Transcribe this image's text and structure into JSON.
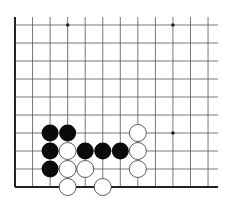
{
  "board": {
    "columns": 12,
    "rows": 10,
    "origin": {
      "x": 15,
      "y": 25
    },
    "spacing": {
      "x": 17.55,
      "y": 18
    },
    "line_extend_right": 10,
    "edges": [
      "left",
      "bottom"
    ],
    "colors": {
      "line": "#555555",
      "edge": "#222222",
      "star": "#222222",
      "black_stone": "#0a0a0a",
      "white_stone": "#ffffff",
      "white_stroke": "#333333",
      "background": "#ffffff"
    },
    "star_points": [
      {
        "col": 3,
        "row": 0
      },
      {
        "col": 9,
        "row": 0
      },
      {
        "col": 9,
        "row": 6
      }
    ],
    "stones": [
      {
        "color": "black",
        "col": 2,
        "row": 6
      },
      {
        "color": "black",
        "col": 3,
        "row": 6
      },
      {
        "color": "black",
        "col": 2,
        "row": 7
      },
      {
        "color": "black",
        "col": 4,
        "row": 7
      },
      {
        "color": "black",
        "col": 5,
        "row": 7
      },
      {
        "color": "black",
        "col": 6,
        "row": 7
      },
      {
        "color": "black",
        "col": 2,
        "row": 8
      },
      {
        "color": "white",
        "col": 3,
        "row": 7
      },
      {
        "color": "white",
        "col": 3,
        "row": 8
      },
      {
        "color": "white",
        "col": 4,
        "row": 8
      },
      {
        "color": "white",
        "col": 3,
        "row": 9
      },
      {
        "color": "white",
        "col": 5,
        "row": 9
      },
      {
        "color": "white",
        "col": 7,
        "row": 6
      },
      {
        "color": "white",
        "col": 7,
        "row": 7
      },
      {
        "color": "white",
        "col": 7,
        "row": 8
      }
    ]
  }
}
